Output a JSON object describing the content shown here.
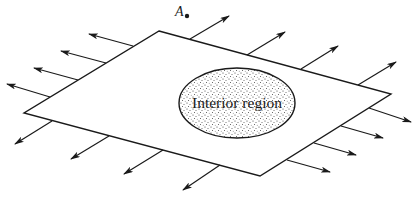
{
  "diagram": {
    "type": "surface with outward normal arrows enclosing an interior region",
    "point_label": "A",
    "region_label": "Interior region",
    "colors": {
      "line": "#1a1a1a",
      "background": "#ffffff",
      "stipple": "#3a3a3a"
    },
    "surface": {
      "shape": "parallelogram",
      "corners": [
        [
          159,
          31
        ],
        [
          391,
          94
        ],
        [
          260,
          176
        ],
        [
          24,
          113
        ]
      ]
    },
    "interior_region": {
      "shape": "ellipse",
      "cx": 237,
      "cy": 103,
      "rx": 58,
      "ry": 35,
      "fill": "stippled"
    },
    "point_A": {
      "x": 186,
      "y": 16
    },
    "arrows": [
      {
        "edge": "top-left",
        "count": 4,
        "direction": "up-left"
      },
      {
        "edge": "top-right",
        "count": 4,
        "direction": "up-right"
      },
      {
        "edge": "bottom-left",
        "count": 4,
        "direction": "down-left"
      },
      {
        "edge": "bottom-right",
        "count": 4,
        "direction": "right"
      }
    ]
  }
}
